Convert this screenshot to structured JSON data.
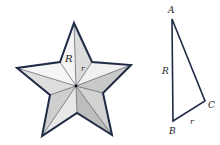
{
  "star": {
    "labels": {
      "R": "R",
      "r": "r"
    },
    "colors": {
      "outline": "#1f2a44",
      "light": "#f2f2f2",
      "mid": "#d6d6d6",
      "dark": "#b8b8b8"
    }
  },
  "triangle": {
    "labels": {
      "A": "A",
      "B": "B",
      "C": "C",
      "R": "R",
      "r": "r"
    },
    "colors": {
      "outline": "#1f2a44"
    }
  }
}
